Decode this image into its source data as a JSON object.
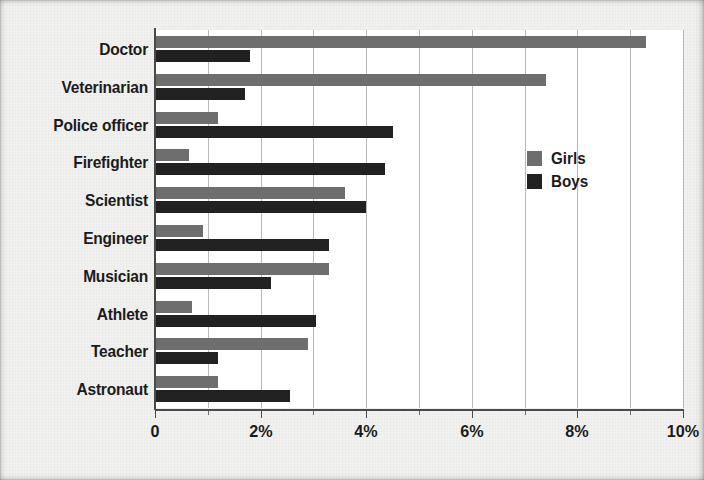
{
  "chart_data": {
    "type": "bar",
    "orientation": "horizontal",
    "title": "",
    "xlabel": "",
    "ylabel": "",
    "xlim": [
      0,
      10
    ],
    "xticks": [
      0,
      2,
      4,
      6,
      8,
      10
    ],
    "xtick_labels": [
      "0",
      "2%",
      "4%",
      "6%",
      "8%",
      "10%"
    ],
    "grid": true,
    "grid_axis": "x",
    "grid_step": 1,
    "legend_position": "center-right",
    "categories": [
      "Doctor",
      "Veterinarian",
      "Police officer",
      "Firefighter",
      "Scientist",
      "Engineer",
      "Musician",
      "Athlete",
      "Teacher",
      "Astronaut"
    ],
    "series": [
      {
        "name": "Girls",
        "color": "#6e6e6e",
        "values": [
          9.3,
          7.4,
          1.2,
          0.65,
          3.6,
          0.9,
          3.3,
          0.7,
          2.9,
          1.2
        ]
      },
      {
        "name": "Boys",
        "color": "#212121",
        "values": [
          1.8,
          1.7,
          4.5,
          4.35,
          4.0,
          3.3,
          2.2,
          3.05,
          1.2,
          2.55
        ]
      }
    ]
  },
  "legend": {
    "items": [
      {
        "label": "Girls",
        "color": "#6e6e6e"
      },
      {
        "label": "Boys",
        "color": "#212121"
      }
    ]
  },
  "colors": {
    "girls": "#6e6e6e",
    "boys": "#212121",
    "gridline": "#b9b9b9",
    "axis": "#4a4a4a",
    "plot_background": "#ffffff",
    "page_background": "#f1f1f0",
    "text": "#1b1b1b"
  }
}
